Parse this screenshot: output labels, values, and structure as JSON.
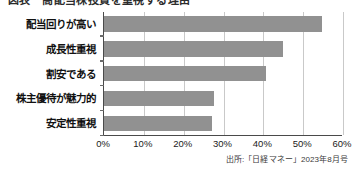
{
  "figure": {
    "title_clipped": "図表　高配当株投資を重視する理由",
    "source_note": "出所:「日経マネー」2023年8月号"
  },
  "chart_data": {
    "type": "bar",
    "orientation": "horizontal",
    "title": "",
    "xlabel": "",
    "ylabel": "",
    "categories": [
      "配当回りが高い",
      "成長性重視",
      "割安である",
      "株主優待が魅力的",
      "安定性重視"
    ],
    "values": [
      54.8,
      45.0,
      40.7,
      27.6,
      27.0
    ],
    "xlim": [
      0,
      60
    ],
    "xticks": [
      0,
      10,
      20,
      30,
      40,
      50,
      60
    ],
    "xtick_labels": [
      "0%",
      "10%",
      "20%",
      "30%",
      "40%",
      "50%",
      "60%"
    ],
    "grid": true,
    "grid_axis": "x",
    "legend": false,
    "bar_color": "#919191",
    "axis_color": "#4a4a4a",
    "gridline_color": "#c9c9c9",
    "value_suffix": "%"
  }
}
